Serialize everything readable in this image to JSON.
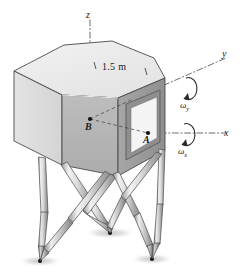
{
  "figure": {
    "background_color": "#ffffff",
    "ink_color": "#1a1a1a"
  },
  "axes": [
    {
      "id": "z",
      "label": "z",
      "orientation": "vertical-up",
      "line_style": "dash-dot"
    },
    {
      "id": "y",
      "label": "y",
      "orientation": "upper-right",
      "line_style": "dash-dot"
    },
    {
      "id": "x",
      "label": "x",
      "orientation": "right",
      "line_style": "dash-dot"
    }
  ],
  "rotations": [
    {
      "id": "omega-y",
      "symbol": "ω",
      "subscript": "y",
      "about_axis": "y",
      "arrow": "circular-ccw"
    },
    {
      "id": "omega-x",
      "symbol": "ω",
      "subscript": "x",
      "about_axis": "x",
      "arrow": "circular-ccw"
    }
  ],
  "points": [
    {
      "id": "A",
      "label": "A",
      "location": "right face near window, on x-axis"
    },
    {
      "id": "B",
      "label": "B",
      "location": "front face, on z-axis"
    }
  ],
  "dimensions": [
    {
      "id": "top-edge-width",
      "label": "1.5 m",
      "value": 1.5,
      "unit": "m",
      "location": "top face rear-right edge"
    }
  ],
  "body": {
    "shape": "hexagonal-prism",
    "top_face_color": "#ebebeb",
    "left_face_color": "#dedede",
    "front_face_color": "#b4b4b4",
    "right_face_color": "#9e9e9e",
    "edge_color": "#4a4a4a",
    "window": {
      "id": "right-face-panel",
      "fill": "#f2f2f2",
      "frame": "#8a8a8a"
    }
  },
  "legs": {
    "count": 6,
    "type": "linear-actuator",
    "arrangement": "crossed-pairs",
    "body_color": "#d8d8d8",
    "tip_color": "#8f8f8f",
    "foot_dot_color": "#111111"
  },
  "shadows": {
    "color": "#d9d9d9",
    "count": 3
  }
}
